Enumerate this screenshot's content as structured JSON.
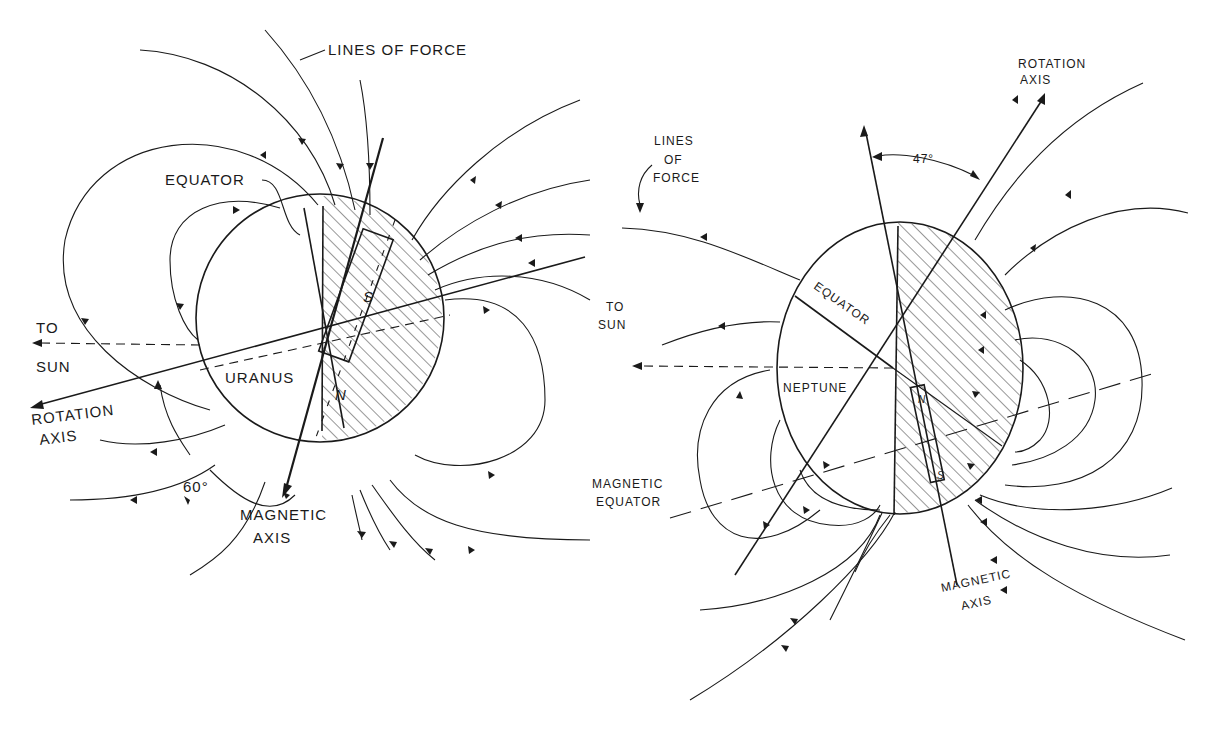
{
  "figure": {
    "panels": [
      {
        "id": "uranus",
        "planet_label": "URANUS",
        "labels": {
          "lines_of_force": "LINES OF FORCE",
          "equator": "EQUATOR",
          "to_sun_line1": "TO",
          "to_sun_line2": "SUN",
          "rotation_axis_line1": "ROTATION",
          "rotation_axis_line2": "AXIS",
          "angle": "60°",
          "magnetic_axis_line1": "MAGNETIC",
          "magnetic_axis_line2": "AXIS",
          "magnet_south": "S",
          "magnet_north": "N"
        },
        "tilt_angle_deg": 60
      },
      {
        "id": "neptune",
        "planet_label": "NEPTUNE",
        "labels": {
          "lines_of_force_line1": "LINES",
          "lines_of_force_line2": "OF",
          "lines_of_force_line3": "FORCE",
          "equator": "EQUATOR",
          "to_sun_line1": "TO",
          "to_sun_line2": "SUN",
          "rotation_axis_line1": "ROTATION",
          "rotation_axis_line2": "AXIS",
          "angle": "47°",
          "magnetic_equator_line1": "MAGNETIC",
          "magnetic_equator_line2": "EQUATOR",
          "magnetic_axis_line1": "MAGNETIC",
          "magnetic_axis_line2": "AXIS",
          "magnet_north": "N",
          "magnet_south": "S"
        },
        "tilt_angle_deg": 47
      }
    ]
  }
}
